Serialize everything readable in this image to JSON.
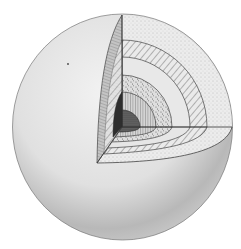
{
  "figure": {
    "colors": {
      "background": "#ffffff",
      "sphere_light": "#f0f0f0",
      "sphere_mid": "#d8d8d8",
      "sphere_dark": "#a8a8a8",
      "outline": "#555555",
      "layer_fill": "#e6e6e6",
      "core": "#3a3a3a"
    }
  }
}
